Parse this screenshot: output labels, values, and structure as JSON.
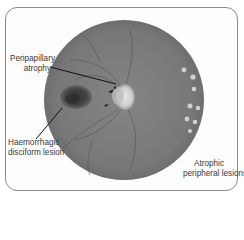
{
  "figure": {
    "type": "fundus-photograph",
    "labels": {
      "peripapillary_atrophy": {
        "line1": "Peripapillary",
        "line2": "atrophy"
      },
      "haemorrhagic_lesion": {
        "line1": "Haemorrhagic",
        "line2": "disciform lesion"
      },
      "atrophic_lesions": {
        "line1": "Atrophic",
        "line2": "peripheral lesions"
      }
    },
    "colors": {
      "fundus": "#7c7c7c",
      "optic_disc": "#d8d8d8",
      "haemorrhage": "#3c3c3c",
      "lesions": "#cfcfcf",
      "frame_border": "#8a8a8a",
      "leader_line": "#111111"
    }
  }
}
